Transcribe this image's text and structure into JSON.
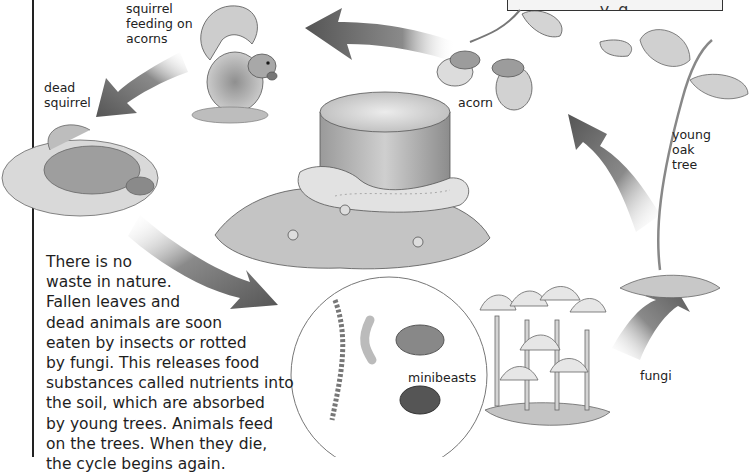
{
  "caption_box": {
    "visible_text": "y    g"
  },
  "labels": {
    "squirrel_feeding": "squirrel\nfeeding on\nacorns",
    "dead_squirrel": "dead\nsquirrel",
    "acorn": "acorn",
    "young_oak_tree": "young\noak\ntree",
    "minibeasts": "minibeasts",
    "fungi": "fungi"
  },
  "body_text": {
    "lines": [
      "There is no",
      "waste in nature.",
      "Fallen leaves and",
      "dead animals are soon",
      "eaten by insects or rotted",
      "by fungi. This releases food",
      "substances called nutrients into",
      "the soil, which are absorbed",
      "by young trees. Animals feed",
      "on the trees. When they die,",
      "the cycle begins again."
    ]
  },
  "illustrations": [
    "squirrel-eating-acorn",
    "dead-squirrel-on-leaves",
    "tree-stump-with-bracket-fungi-and-snails",
    "acorns-on-oak-twig",
    "young-oak-tree-seedling",
    "minibeasts-circle-centipede-grub-woodlouse-beetle",
    "fungi-mushroom-cluster"
  ],
  "arrows": [
    {
      "from": "acorn",
      "to": "squirrel-feeding",
      "direction": "left"
    },
    {
      "from": "squirrel-feeding",
      "to": "dead-squirrel",
      "direction": "down-left"
    },
    {
      "from": "dead-squirrel",
      "to": "minibeasts",
      "direction": "down-right"
    },
    {
      "from": "fungi",
      "to": "young-oak-tree",
      "direction": "up-right"
    },
    {
      "from": "young-oak-tree",
      "to": "acorn",
      "direction": "up-left"
    }
  ],
  "colors": {
    "arrow_dark": "#5a5a5a",
    "arrow_light": "#ffffff",
    "ink": "#222222",
    "background": "#ffffff"
  }
}
